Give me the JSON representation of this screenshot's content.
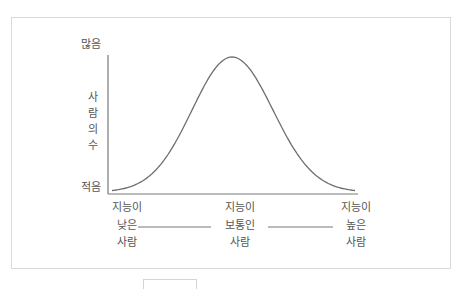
{
  "chart_data": {
    "type": "line",
    "title": "",
    "ylabel": "사람의 수",
    "ylabel_chars": [
      "사",
      "람",
      "의",
      "수"
    ],
    "y_top_label": "많음",
    "y_bottom_label": "적음",
    "x_categories": [
      {
        "lines": [
          "지능이",
          "낮은",
          "사람"
        ]
      },
      {
        "lines": [
          "지능이",
          "보통인",
          "사람"
        ]
      },
      {
        "lines": [
          "지능이",
          "높은",
          "사람"
        ]
      }
    ],
    "x": [
      -3,
      -2.5,
      -2,
      -1.5,
      -1,
      -0.5,
      0,
      0.5,
      1,
      1.5,
      2,
      2.5,
      3
    ],
    "values": [
      0.011,
      0.044,
      0.135,
      0.325,
      0.607,
      0.882,
      1.0,
      0.882,
      0.607,
      0.325,
      0.135,
      0.044,
      0.011
    ],
    "ylim": [
      0,
      1
    ],
    "grid": false,
    "legend": null
  },
  "colors": {
    "curve": "#6e6e6e",
    "axis": "#7a7a7a",
    "frame": "#d9d9d9",
    "text": "#555555"
  }
}
